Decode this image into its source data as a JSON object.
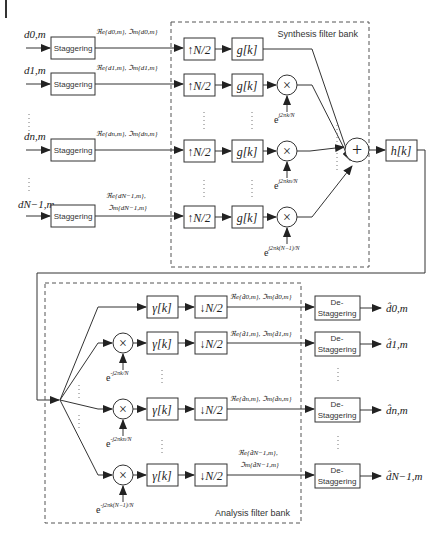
{
  "synthesis": {
    "title": "Synthesis filter bank",
    "inputs": [
      "d0,m",
      "d1,m",
      "dn,m",
      "dN−1,m"
    ],
    "stagger_label": "Staggering",
    "stagger_outputs": [
      "ℜe{d0,m}, ℑm{d0,m}",
      "ℜe{d1,m}, ℑm{d1,m}",
      "ℜe{dn,m}, ℑm{dn,m}",
      "ℜe{dN−1,m},",
      "ℑm{dN−1,m}"
    ],
    "upsampler": "↑N/2",
    "filter": "g[k]",
    "modulators": [
      "e j2πk/N",
      "e j2πkn/N",
      "e j2πk(N−1)/N"
    ],
    "sum_symbol": "+",
    "channel": "h[k]"
  },
  "analysis": {
    "title": "Analysis filter bank",
    "filter": "γ[k]",
    "downsampler": "↓N/2",
    "demodulators": [
      "e −j2πk/N",
      "e −j2πkn/N",
      "e −j2πk(N−1)/N"
    ],
    "filter_outputs": [
      "ℜe{d̂0,m}, ℑm{d̂0,m}",
      "ℜe{d̂1,m}, ℑm{d̂1,m}",
      "ℜe{d̂n,m}, ℑm{d̂n,m}",
      "ℜe{d̂N−1,m},",
      "ℑm{d̂N−1,m}"
    ],
    "destagger_label_1": "De-",
    "destagger_label_2": "Staggering",
    "outputs": [
      "d̂0,m",
      "d̂1,m",
      "d̂n,m",
      "d̂N−1,m"
    ]
  },
  "symbols": {
    "multiply": "×"
  }
}
